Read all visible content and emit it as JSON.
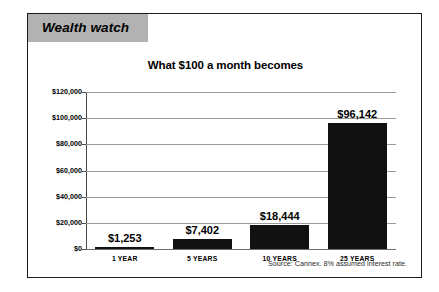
{
  "card": {
    "banner_label": "Wealth watch"
  },
  "chart_data": {
    "type": "bar",
    "title": "What $100 a month becomes",
    "xlabel": "",
    "ylabel": "",
    "categories": [
      "1 YEAR",
      "5 YEARS",
      "10 YEARS",
      "25 YEARS"
    ],
    "values": [
      1253,
      7402,
      18444,
      96142
    ],
    "value_labels": [
      "$1,253",
      "$7,402",
      "$18,444",
      "$96,142"
    ],
    "ylim": [
      0,
      120000
    ],
    "ytick_labels": [
      "$0",
      "$20,000",
      "$40,000",
      "$60,000",
      "$80,000",
      "$100,000",
      "$120,000"
    ],
    "ytick_values": [
      0,
      20000,
      40000,
      60000,
      80000,
      100000,
      120000
    ],
    "grid": true,
    "legend": "none",
    "bar_color": "#111111",
    "annotation": "Source: Cannex. 8% assumed interest rate."
  }
}
